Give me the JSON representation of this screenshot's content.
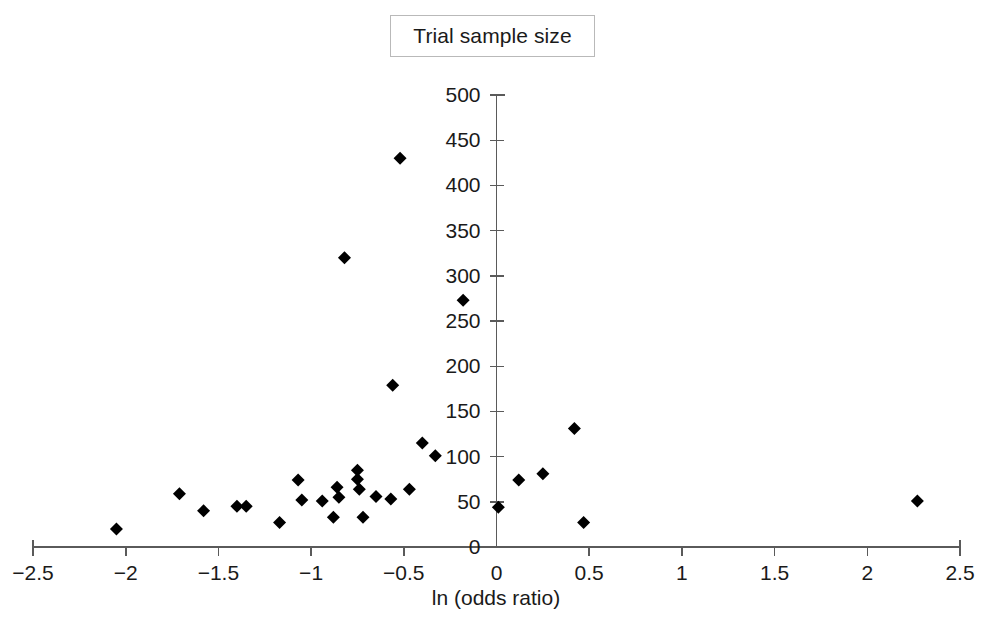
{
  "legend": {
    "label": "Trial sample size"
  },
  "chart_data": {
    "type": "scatter",
    "title": "",
    "legend_entries": [
      "Trial sample size"
    ],
    "legend_position": "top-center",
    "grid": false,
    "xlabel": "ln (odds ratio)",
    "ylabel": "",
    "xlim": [
      -2.5,
      2.5
    ],
    "ylim": [
      0,
      500
    ],
    "xticks": [
      -2.5,
      -2,
      -1.5,
      -1,
      -0.5,
      0,
      0.5,
      1,
      1.5,
      2,
      2.5
    ],
    "xtick_labels": [
      "−2.5",
      "−2",
      "−1.5",
      "−1",
      "−0.5",
      "0",
      "0.5",
      "1",
      "1.5",
      "2",
      "2.5"
    ],
    "yticks": [
      0,
      50,
      100,
      150,
      200,
      250,
      300,
      350,
      400,
      450,
      500
    ],
    "ytick_labels": [
      "0",
      "50",
      "100",
      "150",
      "200",
      "250",
      "300",
      "350",
      "400",
      "450",
      "500"
    ],
    "marker": "diamond",
    "marker_color": "#000000",
    "marker_size": 13,
    "points": [
      {
        "x": -2.05,
        "y": 20
      },
      {
        "x": -1.71,
        "y": 59
      },
      {
        "x": -1.58,
        "y": 40
      },
      {
        "x": -1.4,
        "y": 45
      },
      {
        "x": -1.35,
        "y": 45
      },
      {
        "x": -1.17,
        "y": 27
      },
      {
        "x": -1.07,
        "y": 74
      },
      {
        "x": -1.05,
        "y": 52
      },
      {
        "x": -0.94,
        "y": 51
      },
      {
        "x": -0.88,
        "y": 33
      },
      {
        "x": -0.86,
        "y": 66
      },
      {
        "x": -0.85,
        "y": 55
      },
      {
        "x": -0.75,
        "y": 85
      },
      {
        "x": -0.75,
        "y": 75
      },
      {
        "x": -0.74,
        "y": 64
      },
      {
        "x": -0.72,
        "y": 33
      },
      {
        "x": -0.82,
        "y": 320
      },
      {
        "x": -0.65,
        "y": 56
      },
      {
        "x": -0.56,
        "y": 179
      },
      {
        "x": -0.52,
        "y": 430
      },
      {
        "x": -0.57,
        "y": 53
      },
      {
        "x": -0.47,
        "y": 64
      },
      {
        "x": -0.4,
        "y": 115
      },
      {
        "x": -0.33,
        "y": 101
      },
      {
        "x": -0.18,
        "y": 273
      },
      {
        "x": 0.01,
        "y": 44
      },
      {
        "x": 0.12,
        "y": 74
      },
      {
        "x": 0.25,
        "y": 81
      },
      {
        "x": 0.42,
        "y": 131
      },
      {
        "x": 0.47,
        "y": 27
      },
      {
        "x": 2.27,
        "y": 51
      }
    ]
  },
  "axes": {
    "x_axis_label": "ln (odds ratio)",
    "y_axis_label": ""
  }
}
